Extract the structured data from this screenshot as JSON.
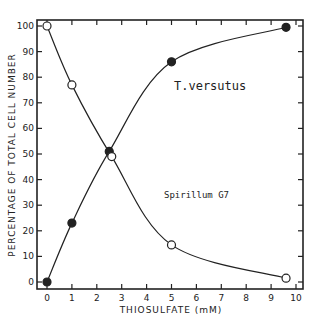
{
  "chart_data": {
    "type": "line",
    "title": "",
    "xlabel": "THIOSULFATE (mM)",
    "ylabel": "PERCENTAGE OF TOTAL CELL NUMBER",
    "xlim": [
      0,
      10
    ],
    "ylim": [
      0,
      100
    ],
    "x_ticks": [
      0,
      1,
      2,
      3,
      4,
      5,
      6,
      7,
      8,
      9,
      10
    ],
    "y_ticks": [
      0,
      10,
      20,
      30,
      40,
      50,
      60,
      70,
      80,
      90,
      100
    ],
    "grid": false,
    "legend": "inline labels",
    "series": [
      {
        "name": "T.versutus",
        "marker": "filled-circle",
        "x": [
          0,
          1,
          2.5,
          5,
          9.6
        ],
        "values": [
          0,
          23,
          51,
          86,
          99.5
        ]
      },
      {
        "name": "Spirillum G7",
        "marker": "open-circle",
        "x": [
          0,
          1,
          2.6,
          5,
          9.6
        ],
        "values": [
          100,
          77,
          49,
          14.5,
          1.5
        ]
      }
    ],
    "annotations": [
      {
        "text": "T.versutus",
        "x": 5.1,
        "y": 75
      },
      {
        "text": "Spirillum G7",
        "x": 4.7,
        "y": 33
      }
    ]
  },
  "colors": {
    "ink": "#222222",
    "background": "#ffffff"
  }
}
